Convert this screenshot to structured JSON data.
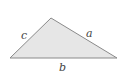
{
  "diagram": {
    "type": "triangle",
    "vertices": {
      "left": [
        10,
        58
      ],
      "top": [
        51,
        18
      ],
      "right": [
        117,
        58
      ]
    },
    "fill_color": "#e6e6e6",
    "stroke_color": "#8a8a8a",
    "labels": {
      "a": {
        "text": "a",
        "x": 86,
        "y": 37
      },
      "b": {
        "text": "b",
        "x": 59,
        "y": 71
      },
      "c": {
        "text": "c",
        "x": 21,
        "y": 39
      }
    }
  }
}
